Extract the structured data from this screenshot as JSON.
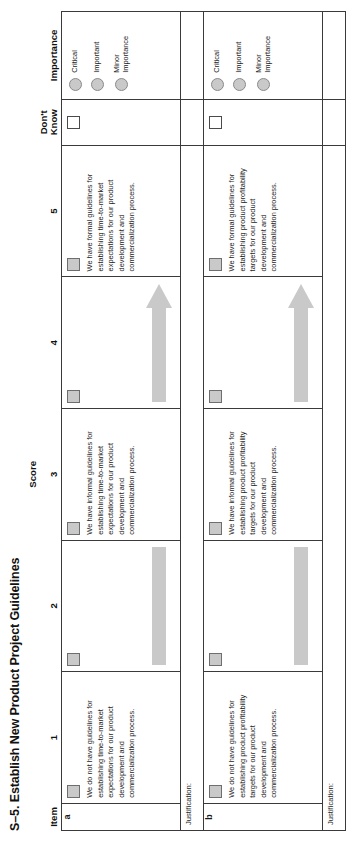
{
  "document": {
    "title": "S–5. Establish New Product Project Guidelines"
  },
  "table": {
    "headers": {
      "item": "Item",
      "score_group": "Score",
      "score_1": "1",
      "score_2": "2",
      "score_3": "3",
      "score_4": "4",
      "score_5": "5",
      "dont_know_line1": "Don't",
      "dont_know_line2": "Know",
      "importance": "Importance"
    },
    "importance_options": [
      "Critical",
      "Important",
      "Minor\nImportance"
    ],
    "importance_option_1": "Critical",
    "importance_option_2": "Important",
    "importance_option_3": "Minor Importance",
    "justification_label": "Justification:",
    "rows": [
      {
        "item": "a",
        "score_1_text": "We do not have guidelines for establishing time-to-market expectations for our product development and commercialization process.",
        "score_3_text": "We have informal guidelines for establishing time-to-market expectations for our product development and commercialization process.",
        "score_5_text": "We have formal guidelines for establishing time-to-market expectations for our product development and commercialization process."
      },
      {
        "item": "b",
        "score_1_text": "We do not have guidelines for establishing product profitability targets for our product development and commercialization process.",
        "score_3_text": "We have informal guidelines for establishing product profitability targets for our product development and commercialization process.",
        "score_5_text": "We have formal guidelines for establishing product profitability targets for our product development and commercialization process."
      }
    ]
  },
  "colors": {
    "checkbox_fill": "#c9c9c9",
    "checkbox_border": "#6e6e6e",
    "arrow_fill": "#c9c9c9",
    "table_border": "#3a3a3a",
    "text": "#1d1d1d"
  }
}
